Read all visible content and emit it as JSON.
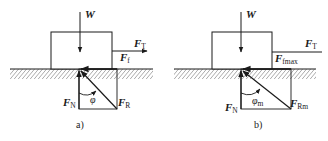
{
  "figure": {
    "panels": [
      {
        "caption": "a)",
        "labels": {
          "weight": "W",
          "tension_main": "F",
          "tension_sub": "T",
          "friction_main": "F",
          "friction_sub": "f",
          "normal_main": "F",
          "normal_sub": "N",
          "resultant_main": "F",
          "resultant_sub": "R",
          "angle": "φ",
          "angle_sub": ""
        }
      },
      {
        "caption": "b)",
        "labels": {
          "weight": "W",
          "tension_main": "F",
          "tension_sub": "T",
          "friction_main": "F",
          "friction_sub": "fmax",
          "normal_main": "F",
          "normal_sub": "N",
          "resultant_main": "F",
          "resultant_sub": "Rm",
          "angle": "φ",
          "angle_sub": "m"
        }
      }
    ],
    "colors": {
      "stroke": "#1a1a1a",
      "background": "#ffffff"
    }
  }
}
